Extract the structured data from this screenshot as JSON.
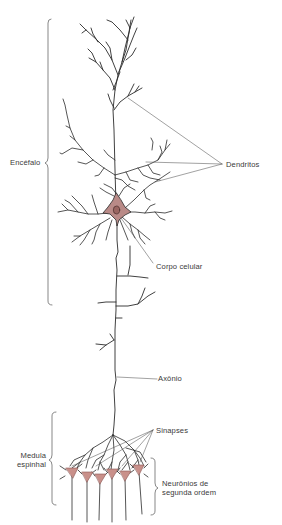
{
  "figure": {
    "colors": {
      "background": "#ffffff",
      "line": "#2b2b2b",
      "leader": "#555555",
      "soma_fill": "#b98a87",
      "soma_dark": "#8a5552",
      "text": "#3a3a3a"
    }
  },
  "labels": {
    "encefalo": "Encéfalo",
    "dendritos": "Dendritos",
    "corpo_celular": "Corpo celular",
    "axonio": "Axônio",
    "sinapses": "Sinapses",
    "medula_espinhal": "Medula\nespinhal",
    "neuronios_segunda_ordem": "Neurônios de\nsegunda ordem"
  },
  "regions": [
    {
      "name": "Encéfalo",
      "bracket_y": [
        20,
        305
      ],
      "side": "left"
    },
    {
      "name": "Medula espinhal",
      "bracket_y": [
        412,
        505
      ],
      "side": "left"
    },
    {
      "name": "Neurônios de segunda ordem",
      "bracket_y": [
        458,
        515
      ],
      "side": "right"
    }
  ],
  "second_order_neurons_count": 6
}
